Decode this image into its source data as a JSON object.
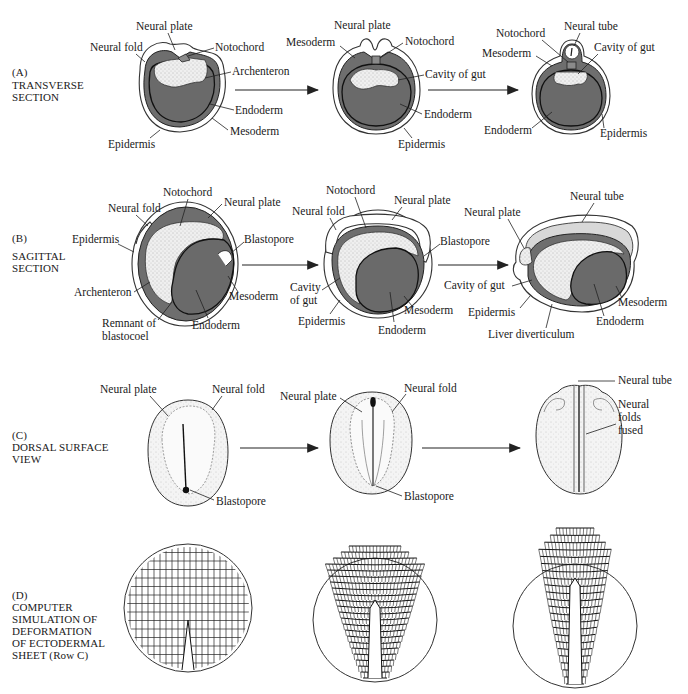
{
  "rows": {
    "A": {
      "title_lines": [
        "(A)",
        "TRANSVERSE",
        "SECTION"
      ],
      "stage1": [
        "Neural plate",
        "Neural fold",
        "Notochord",
        "Archenteron",
        "Endoderm",
        "Mesoderm",
        "Epidermis"
      ],
      "stage2": [
        "Neural plate",
        "Mesoderm",
        "Notochord",
        "Cavity of gut",
        "Endoderm",
        "Epidermis"
      ],
      "stage3": [
        "Neural tube",
        "Notochord",
        "Mesoderm",
        "Cavity of gut",
        "Endoderm",
        "Epidermis"
      ]
    },
    "B": {
      "title_lines": [
        "(B)",
        "SAGITTAL",
        "SECTION"
      ],
      "stage1": [
        "Notochord",
        "Neural fold",
        "Neural plate",
        "Epidermis",
        "Blastopore",
        "Archenteron",
        "Mesoderm",
        "Remnant of",
        "blastocoel",
        "Endoderm"
      ],
      "stage2": [
        "Notochord",
        "Neural plate",
        "Neural fold",
        "Blastopore",
        "Cavity",
        "of gut",
        "Mesoderm",
        "Epidermis",
        "Endoderm"
      ],
      "stage3": [
        "Neural tube",
        "Neural plate",
        "Cavity of gut",
        "Mesoderm",
        "Epidermis",
        "Endoderm",
        "Liver diverticulum"
      ]
    },
    "C": {
      "title_lines": [
        "(C)",
        "DORSAL SURFACE",
        "VIEW"
      ],
      "stage1": [
        "Neural plate",
        "Neural fold",
        "Blastopore"
      ],
      "stage2": [
        "Neural plate",
        "Neural fold",
        "Blastopore"
      ],
      "stage3": [
        "Neural tube",
        "Neural",
        "folds",
        "fused"
      ]
    },
    "D": {
      "title_lines": [
        "(D)",
        "COMPUTER",
        "SIMULATION OF",
        "DEFORMATION",
        "OF ECTODERMAL",
        "SHEET (Row C)"
      ]
    }
  },
  "colors": {
    "tissue_dark": "#6e6e6e",
    "ink": "#1a1a1a",
    "paper": "#ffffff"
  }
}
